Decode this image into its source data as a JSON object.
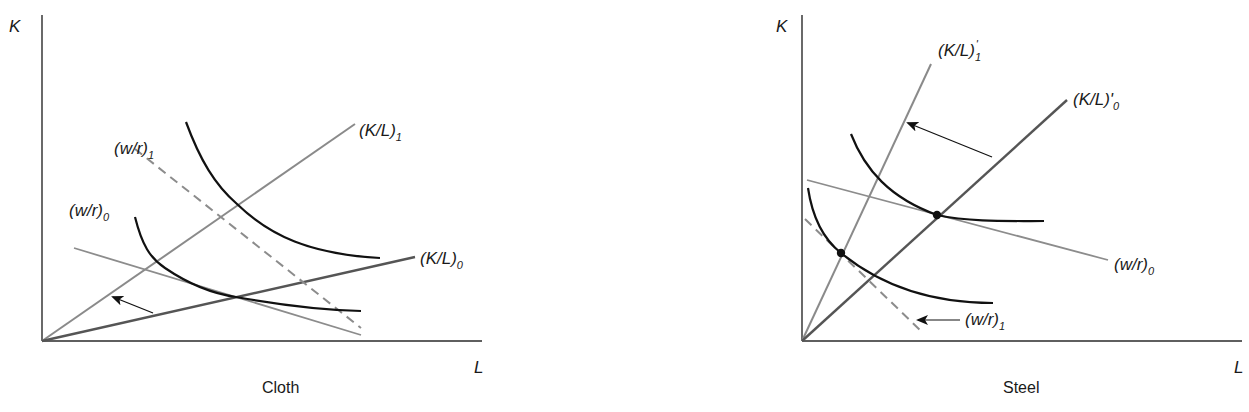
{
  "diagrams": {
    "cloth": {
      "title": "Cloth",
      "axes": {
        "y_label": "K",
        "x_label": "L"
      },
      "rays": [
        {
          "id": "KL1",
          "label_main": "(K/L)",
          "label_sub": "1"
        },
        {
          "id": "KL0",
          "label_main": "(K/L)",
          "label_sub": "0"
        }
      ],
      "price_lines": [
        {
          "id": "wr1",
          "label_main": "(w/r)",
          "label_sub": "1",
          "style": "dashed"
        },
        {
          "id": "wr0",
          "label_main": "(w/r)",
          "label_sub": "0",
          "style": "solid"
        }
      ],
      "isoquants": 2,
      "arrow": "rotation from (K/L)0 toward (K/L)1"
    },
    "steel": {
      "title": "Steel",
      "axes": {
        "y_label": "K",
        "x_label": "L"
      },
      "rays": [
        {
          "id": "KL1p",
          "label_main": "(K/L)",
          "label_prime": "'",
          "label_sub": "1"
        },
        {
          "id": "KL0p",
          "label_main": "(K/L)",
          "label_prime": "'",
          "label_sub": "0"
        }
      ],
      "price_lines": [
        {
          "id": "wr0",
          "label_main": "(w/r)",
          "label_sub": "0",
          "style": "solid"
        },
        {
          "id": "wr1",
          "label_main": "(w/r)",
          "label_sub": "1",
          "style": "dashed"
        }
      ],
      "isoquants": 2,
      "tangency_points": 2,
      "arrow": "rotation from (K/L)'0 toward (K/L)'1"
    }
  },
  "colors": {
    "axis": "#2a2a2a",
    "isoquant": "#111111",
    "ray_light": "#8a8a8a",
    "ray_dark": "#555555",
    "price_line": "#8c8c8c"
  }
}
